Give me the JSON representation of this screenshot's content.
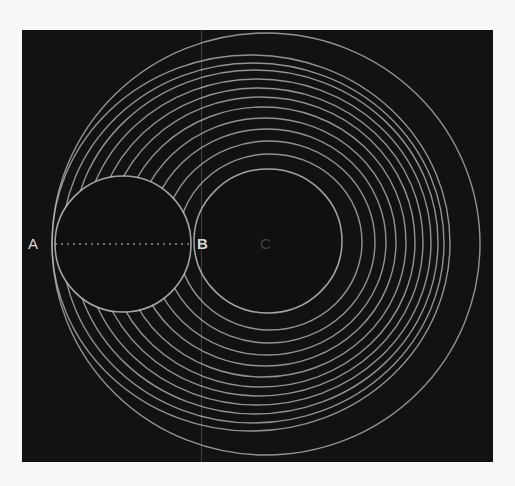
{
  "figure": {
    "background": "#121212",
    "line_color": "#bdbdbd",
    "labels": {
      "a": "A",
      "b": "B",
      "c": "C"
    },
    "small_circle": {
      "cx": 101,
      "cy": 214,
      "r": 68
    },
    "inner_circle": {
      "cx": 246,
      "cy": 211,
      "rx": 74,
      "ry": 72
    },
    "dotted_segment": {
      "x1": 33,
      "x2": 170,
      "y": 214
    },
    "rings": [
      {
        "cx": 248,
        "cy": 212,
        "rx": 92,
        "ry": 88
      },
      {
        "cx": 247,
        "cy": 212,
        "rx": 106,
        "ry": 101
      },
      {
        "cx": 245,
        "cy": 212,
        "rx": 119,
        "ry": 113
      },
      {
        "cx": 243,
        "cy": 212,
        "rx": 131,
        "ry": 124
      },
      {
        "cx": 241,
        "cy": 212,
        "rx": 143,
        "ry": 135
      },
      {
        "cx": 239,
        "cy": 212,
        "rx": 154,
        "ry": 145
      },
      {
        "cx": 237,
        "cy": 212,
        "rx": 164,
        "ry": 154
      },
      {
        "cx": 235,
        "cy": 212,
        "rx": 174,
        "ry": 163
      },
      {
        "cx": 233,
        "cy": 212,
        "rx": 183,
        "ry": 172
      },
      {
        "cx": 231,
        "cy": 213,
        "rx": 191,
        "ry": 180
      },
      {
        "cx": 229,
        "cy": 213,
        "rx": 199,
        "ry": 188
      },
      {
        "cx": 244,
        "cy": 214,
        "rx": 214,
        "ry": 211
      }
    ]
  }
}
